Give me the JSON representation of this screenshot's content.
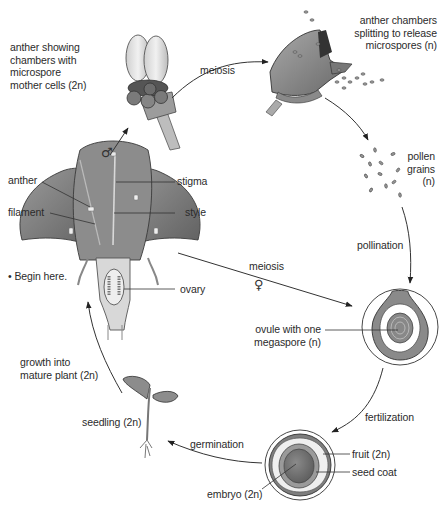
{
  "diagram": {
    "colors": {
      "text": "#2b2b2b",
      "line": "#333333",
      "petal_dark": "#6e6e6e",
      "petal_mid": "#8f8f8f",
      "petal_light": "#bdbdbd",
      "anther_light": "#e6e6e6",
      "background": "#ffffff"
    },
    "labels": {
      "anther_chambers": "anther showing\nchambers with\nmicrospore\nmother cells (2n)",
      "anther_chambers_lines": [
        "anther showing",
        "chambers with",
        "microspore",
        "mother cells (2n)"
      ],
      "meiosis_top": "meiosis",
      "anther_splitting_lines": [
        "anther chambers",
        "splitting to release",
        "microspores (n)"
      ],
      "pollen_grains_lines": [
        "pollen",
        "grains",
        "(n)"
      ],
      "pollination": "pollination",
      "male_symbol": "♂",
      "anther": "anther",
      "filament": "filament",
      "stigma": "stigma",
      "style": "style",
      "begin_here": "• Begin here.",
      "ovary": "ovary",
      "meiosis_middle": "meiosis",
      "female_symbol": "♀",
      "ovule_lines": [
        "ovule with one",
        "megaspore (n)"
      ],
      "growth_lines": [
        "growth into",
        "mature plant (2n)"
      ],
      "fertilization": "fertilization",
      "seedling": "seedling (2n)",
      "germination": "germination",
      "fruit": "fruit (2n)",
      "seed_coat": "seed coat",
      "embryo": "embryo (2n)"
    },
    "stages": [
      {
        "id": "flower",
        "name": "mature flower"
      },
      {
        "id": "anther",
        "name": "anther with microspore mother cells (2n)"
      },
      {
        "id": "anther-split",
        "name": "anther chambers splitting"
      },
      {
        "id": "pollen",
        "name": "pollen grains (n)"
      },
      {
        "id": "ovule",
        "name": "ovule with one megaspore (n)"
      },
      {
        "id": "seed",
        "name": "fruit / seed with embryo (2n)"
      },
      {
        "id": "seedling",
        "name": "seedling (2n)"
      }
    ]
  }
}
